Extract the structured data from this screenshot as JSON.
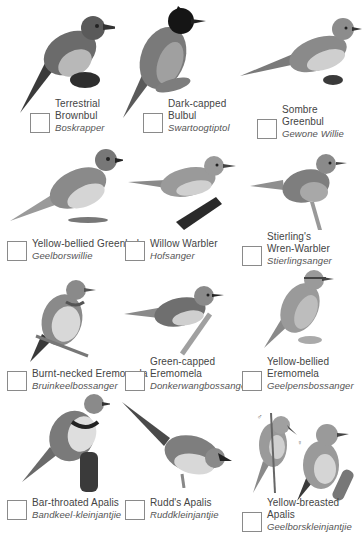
{
  "page": {
    "birds": [
      {
        "name_lines": [
          "Terrestrial",
          "Brownbul"
        ],
        "afrikaans": "Boskrapper"
      },
      {
        "name_lines": [
          "Dark-capped",
          "Bulbul"
        ],
        "afrikaans": "Swartoogtiptol"
      },
      {
        "name_lines": [
          "Sombre Greenbul"
        ],
        "afrikaans": "Gewone Willie"
      },
      {
        "name_lines": [
          "Yellow-bellied Greenbul"
        ],
        "afrikaans": "Geelborswillie"
      },
      {
        "name_lines": [
          "Willow Warbler"
        ],
        "afrikaans": "Hofsanger"
      },
      {
        "name_lines": [
          "Stierling's",
          "Wren-Warbler"
        ],
        "afrikaans": "Stierlingsanger"
      },
      {
        "name_lines": [
          "Burnt-necked Eremomela"
        ],
        "afrikaans": "Bruinkeelbossanger"
      },
      {
        "name_lines": [
          "Green-capped",
          "Eremomela"
        ],
        "afrikaans": "Donkerwangbossanger"
      },
      {
        "name_lines": [
          "Yellow-bellied",
          "Eremomela"
        ],
        "afrikaans": "Geelpensbossanger"
      },
      {
        "name_lines": [
          "Bar-throated Apalis"
        ],
        "afrikaans": "Bandkeel-kleinjantjie"
      },
      {
        "name_lines": [
          "Rudd's Apalis"
        ],
        "afrikaans": "Ruddkleinjantjie"
      },
      {
        "name_lines": [
          "Yellow-breasted Apalis"
        ],
        "afrikaans": "Geelborskleinjantjie"
      }
    ],
    "sex_marks": {
      "male": "♂",
      "female": "♀"
    }
  }
}
